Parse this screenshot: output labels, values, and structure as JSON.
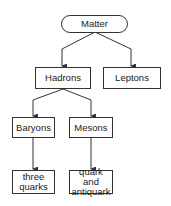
{
  "diagram": {
    "type": "hierarchy",
    "colors": {
      "stroke": "#333333",
      "fill": "#ffffff",
      "text": "#222222"
    },
    "nodes": {
      "matter": {
        "label": "Matter",
        "shape": "rounded"
      },
      "hadrons": {
        "label": "Hadrons",
        "shape": "rect"
      },
      "leptons": {
        "label": "Leptons",
        "shape": "rect"
      },
      "baryons": {
        "label": "Baryons",
        "shape": "rect"
      },
      "mesons": {
        "label": "Mesons",
        "shape": "rect"
      },
      "three_quarks": {
        "label": "three quarks",
        "shape": "rect"
      },
      "quark_antiquark": {
        "label": "quark and antiquark",
        "shape": "rect"
      }
    },
    "edges": [
      {
        "from": "matter",
        "to": "hadrons"
      },
      {
        "from": "matter",
        "to": "leptons"
      },
      {
        "from": "hadrons",
        "to": "baryons"
      },
      {
        "from": "hadrons",
        "to": "mesons"
      },
      {
        "from": "baryons",
        "to": "three_quarks"
      },
      {
        "from": "mesons",
        "to": "quark_antiquark"
      }
    ]
  }
}
